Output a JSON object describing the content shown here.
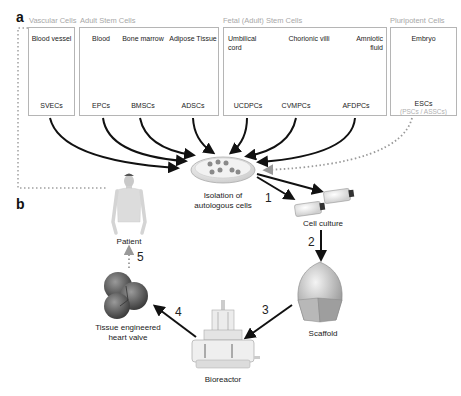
{
  "panels": {
    "a": "a",
    "b": "b"
  },
  "groups": [
    {
      "label": "Vascular Cells"
    },
    {
      "label": "Adult Stem Cells"
    },
    {
      "label": "Fetal (Adult) Stem Cells"
    },
    {
      "label": "Pluripotent Cells"
    }
  ],
  "sources": [
    {
      "name": "Blood vessel",
      "cells": "SVECs",
      "icon": "blood-vessel-icon"
    },
    {
      "name": "Blood",
      "cells": "EPCs",
      "icon": "blood-icon"
    },
    {
      "name": "Bone marrow",
      "cells": "BMSCs",
      "icon": "bone-marrow-icon"
    },
    {
      "name": "Adipose Tissue",
      "cells": "ADSCs",
      "icon": "adipose-tissue-icon"
    },
    {
      "name_line1": "Umbilical",
      "name_line2": "cord",
      "cells": "UCDPCs",
      "icon": "umbilical-cord-icon"
    },
    {
      "name": "Chorionic villi",
      "cells": "CVMPCs",
      "icon": "chorionic-villi-icon"
    },
    {
      "name_line1": "Amniotic",
      "name_line2": "fluid",
      "cells": "AFDPCs",
      "icon": "amniotic-fluid-icon"
    },
    {
      "name": "Embryo",
      "cells": "ESCs",
      "sub": "(PSCs / ASSCs)",
      "icon": "embryo-icon"
    }
  ],
  "workflow": {
    "isolation": {
      "line1": "Isolation of",
      "line2": "autologous cells"
    },
    "cell_culture": "Cell culture",
    "scaffold": "Scaffold",
    "bioreactor": "Bioreactor",
    "valve": {
      "line1": "Tissue engineered",
      "line2": "heart valve"
    },
    "patient": "Patient",
    "steps": [
      "1",
      "2",
      "3",
      "4",
      "5"
    ]
  },
  "colors": {
    "arrow": "#111111",
    "dotted": "#9a9a9a",
    "box_border": "#b5b5b5",
    "group_label": "#a8a8a8"
  }
}
